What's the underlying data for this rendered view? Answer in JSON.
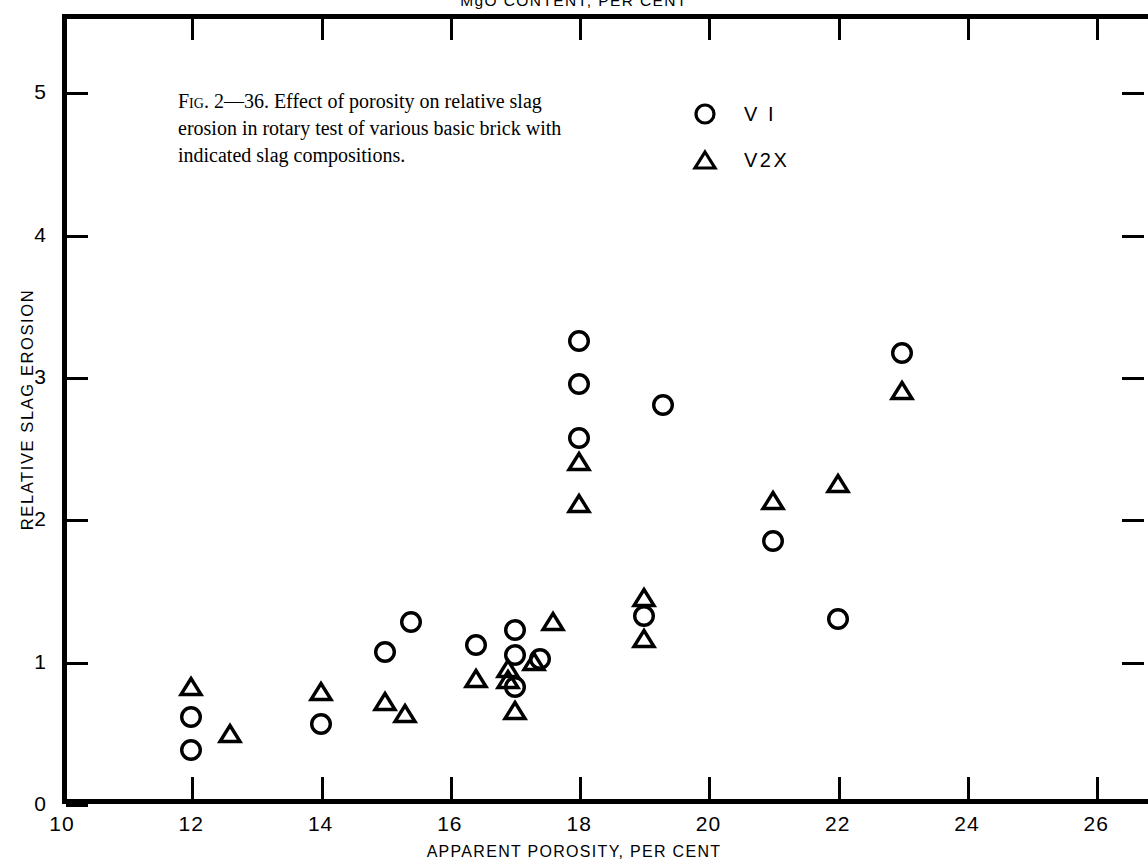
{
  "top_axis_title": "MgO CONTENT, PER CENT",
  "caption": {
    "fig_tag": "Fig. 2—36.",
    "text": " Effect of porosity on relative slag erosion in rotary test of various basic brick with indicated slag compositions."
  },
  "legend": {
    "position": "inside-top-right",
    "items": [
      {
        "symbol": "circle",
        "label": "V I"
      },
      {
        "symbol": "triangle",
        "label": "V2X"
      }
    ]
  },
  "colors": {
    "ink": "#000000",
    "background": "#ffffff"
  },
  "chart_data": {
    "type": "scatter",
    "title": "",
    "xlabel": "APPARENT POROSITY, PER CENT",
    "ylabel": "RELATIVE SLAG EROSION",
    "xlim": [
      10,
      26.8
    ],
    "ylim": [
      0,
      5.55
    ],
    "grid": false,
    "xticks": [
      10,
      12,
      14,
      16,
      18,
      20,
      22,
      24,
      26
    ],
    "xtick_labels": [
      "10",
      "12",
      "14",
      "16",
      "18",
      "20",
      "22",
      "24",
      "26"
    ],
    "yticks": [
      0,
      1,
      2,
      3,
      4,
      5
    ],
    "ytick_labels": [
      "0",
      "1",
      "2",
      "3",
      "4",
      "5"
    ],
    "series": [
      {
        "name": "V I",
        "marker": "circle",
        "points": [
          [
            12.0,
            0.61
          ],
          [
            12.0,
            0.38
          ],
          [
            14.0,
            0.56
          ],
          [
            15.0,
            1.07
          ],
          [
            15.4,
            1.28
          ],
          [
            16.4,
            1.12
          ],
          [
            17.0,
            1.22
          ],
          [
            17.0,
            1.05
          ],
          [
            17.0,
            0.82
          ],
          [
            17.4,
            1.02
          ],
          [
            18.0,
            3.25
          ],
          [
            18.0,
            2.95
          ],
          [
            18.0,
            2.57
          ],
          [
            19.0,
            1.32
          ],
          [
            19.3,
            2.8
          ],
          [
            21.0,
            1.85
          ],
          [
            22.0,
            1.3
          ],
          [
            23.0,
            3.17
          ]
        ]
      },
      {
        "name": "V2X",
        "marker": "triangle",
        "points": [
          [
            12.0,
            0.82
          ],
          [
            12.6,
            0.49
          ],
          [
            14.0,
            0.79
          ],
          [
            15.0,
            0.72
          ],
          [
            15.3,
            0.63
          ],
          [
            16.4,
            0.88
          ],
          [
            16.9,
            0.95
          ],
          [
            16.9,
            0.87
          ],
          [
            17.0,
            0.65
          ],
          [
            17.3,
            1.0
          ],
          [
            17.6,
            1.28
          ],
          [
            18.0,
            2.4
          ],
          [
            18.0,
            2.11
          ],
          [
            19.0,
            1.45
          ],
          [
            19.0,
            1.16
          ],
          [
            21.0,
            2.13
          ],
          [
            22.0,
            2.25
          ],
          [
            23.0,
            2.9
          ]
        ]
      }
    ]
  }
}
